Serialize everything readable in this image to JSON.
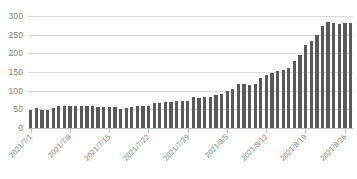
{
  "chart_data": {
    "type": "bar",
    "title": "",
    "subtitle": "",
    "xlabel": "",
    "ylabel": "",
    "ylim": [
      0,
      300
    ],
    "y_ticks": [
      0,
      50,
      100,
      150,
      200,
      250,
      300
    ],
    "grid": true,
    "legend": false,
    "legend_position": "none",
    "bar_color": "#595959",
    "gridline_color": "#d9d9d9",
    "axis_text_color": "#7f7f7f",
    "categories": [
      "2021/7/1",
      "2021/7/2",
      "2021/7/3",
      "2021/7/4",
      "2021/7/5",
      "2021/7/6",
      "2021/7/7",
      "2021/7/8",
      "2021/7/9",
      "2021/7/10",
      "2021/7/11",
      "2021/7/12",
      "2021/7/13",
      "2021/7/14",
      "2021/7/15",
      "2021/7/16",
      "2021/7/17",
      "2021/7/18",
      "2021/7/19",
      "2021/7/20",
      "2021/7/21",
      "2021/7/22",
      "2021/7/23",
      "2021/7/24",
      "2021/7/25",
      "2021/7/26",
      "2021/7/27",
      "2021/7/28",
      "2021/7/29",
      "2021/7/30",
      "2021/7/31",
      "2021/8/1",
      "2021/8/2",
      "2021/8/3",
      "2021/8/4",
      "2021/8/5",
      "2021/8/6",
      "2021/8/7",
      "2021/8/8",
      "2021/8/9",
      "2021/8/10",
      "2021/8/11",
      "2021/8/12",
      "2021/8/13",
      "2021/8/14",
      "2021/8/15",
      "2021/8/16",
      "2021/8/17",
      "2021/8/18",
      "2021/8/19",
      "2021/8/20",
      "2021/8/21",
      "2021/8/22",
      "2021/8/23",
      "2021/8/24",
      "2021/8/25",
      "2021/8/26",
      "2021/8/27"
    ],
    "values": [
      48,
      54,
      47,
      49,
      54,
      60,
      60,
      58,
      60,
      60,
      60,
      58,
      56,
      55,
      55,
      57,
      52,
      53,
      56,
      58,
      58,
      58,
      66,
      68,
      69,
      71,
      73,
      72,
      72,
      83,
      80,
      82,
      84,
      88,
      90,
      98,
      104,
      117,
      119,
      115,
      118,
      133,
      142,
      148,
      153,
      155,
      160,
      180,
      196,
      222,
      234,
      250,
      274,
      283,
      281,
      279,
      280,
      281
    ],
    "x_tick_labels": [
      {
        "index": 0,
        "label": "2021/7/1"
      },
      {
        "index": 7,
        "label": "2021/7/8"
      },
      {
        "index": 14,
        "label": "2021/7/15"
      },
      {
        "index": 21,
        "label": "2021/7/22"
      },
      {
        "index": 28,
        "label": "2021/7/29"
      },
      {
        "index": 35,
        "label": "2021/8/5"
      },
      {
        "index": 42,
        "label": "2021/8/12"
      },
      {
        "index": 49,
        "label": "2021/8/19"
      },
      {
        "index": 56,
        "label": "2021/8/26"
      }
    ]
  }
}
